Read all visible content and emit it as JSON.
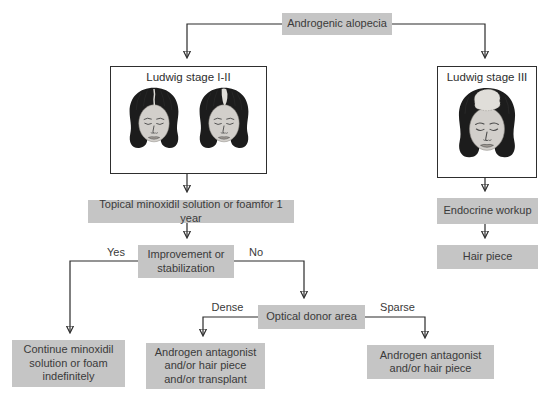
{
  "flowchart": {
    "nodes": {
      "root": {
        "label": "Androgenic alopecia"
      },
      "ludwig_1_2": {
        "label": "Ludwig stage I-II"
      },
      "ludwig_3": {
        "label": "Ludwig stage III"
      },
      "topical": {
        "label": "Topical minoxidil solution or foamfor 1 year"
      },
      "improvement": {
        "label": "Improvement or stabilization"
      },
      "continue_minoxidil": {
        "label": "Continue minoxidil solution or foam indefinitely"
      },
      "optical_donor": {
        "label": "Optical donor area"
      },
      "androgen_transplant": {
        "label": "Androgen antagonist and/or hair piece and/or transplant"
      },
      "androgen_hairpiece": {
        "label": "Androgen antagonist and/or hair piece"
      },
      "endocrine": {
        "label": "Endocrine workup"
      },
      "hair_piece": {
        "label": "Hair piece"
      }
    },
    "branch_labels": {
      "yes": "Yes",
      "no": "No",
      "dense": "Dense",
      "sparse": "Sparse"
    },
    "edges": [
      {
        "from": "root",
        "to": "ludwig_1_2",
        "label": ""
      },
      {
        "from": "root",
        "to": "ludwig_3",
        "label": ""
      },
      {
        "from": "ludwig_1_2",
        "to": "topical",
        "label": ""
      },
      {
        "from": "topical",
        "to": "improvement",
        "label": ""
      },
      {
        "from": "improvement",
        "to": "continue_minoxidil",
        "label": "Yes"
      },
      {
        "from": "improvement",
        "to": "optical_donor",
        "label": "No"
      },
      {
        "from": "optical_donor",
        "to": "androgen_transplant",
        "label": "Dense"
      },
      {
        "from": "optical_donor",
        "to": "androgen_hairpiece",
        "label": "Sparse"
      },
      {
        "from": "ludwig_3",
        "to": "endocrine",
        "label": ""
      },
      {
        "from": "endocrine",
        "to": "hair_piece",
        "label": ""
      }
    ]
  },
  "colors": {
    "box_fill": "#c5c5c5",
    "box_text": "#3a3a3a",
    "line": "#2b2b2b",
    "image_box_border": "#2e2e2e",
    "background": "#ffffff",
    "hair": "#1c1c1c",
    "face": "#d2cfcb",
    "thinning_patch": "#e0ded9"
  }
}
